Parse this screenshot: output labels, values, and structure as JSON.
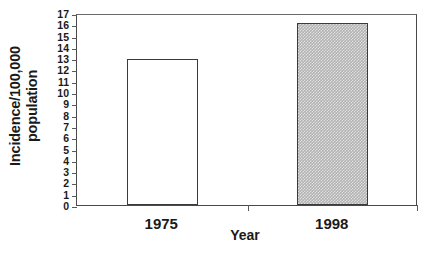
{
  "chart_data": {
    "type": "bar",
    "title": "",
    "categories": [
      "1975",
      "1998"
    ],
    "values": [
      12.9,
      16.1
    ],
    "series": [
      {
        "name": "Incidence",
        "values": [
          12.9,
          16.1
        ]
      }
    ],
    "xlabel": "Year",
    "ylabel": "Incidence/100,000 population",
    "ylabel_lines": [
      "Incidence/100,000",
      "population"
    ],
    "ylim": [
      0,
      17
    ],
    "ytick_labels": [
      "0",
      "1",
      "2",
      "3",
      "4",
      "5",
      "6",
      "7",
      "8",
      "9",
      "10",
      "11",
      "12",
      "13",
      "14",
      "15",
      "16",
      "17"
    ],
    "ytick_values": [
      0,
      1,
      2,
      3,
      4,
      5,
      6,
      7,
      8,
      9,
      10,
      11,
      12,
      13,
      14,
      15,
      16,
      17
    ],
    "ytick_step": 1,
    "grid": false,
    "legend": null,
    "legend_position": "none",
    "bar_styles": [
      {
        "category": "1975",
        "fill": "open",
        "fill_color": "#ffffff",
        "edge_color": "#3b3b3b"
      },
      {
        "category": "1998",
        "fill": "hatch",
        "fill_color": "#b2b2b2",
        "edge_color": "#3b3b3b"
      }
    ],
    "axis_color": "#4a4a4a",
    "background_color": "#ffffff",
    "annotations": []
  }
}
